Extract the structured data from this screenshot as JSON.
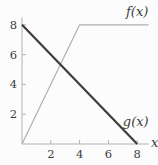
{
  "chart_data": {
    "type": "line",
    "title": "",
    "xlabel": "x",
    "ylabel": "",
    "xlim": [
      0,
      8.8
    ],
    "ylim": [
      0,
      8.5
    ],
    "x_ticks": [
      2,
      4,
      6,
      8
    ],
    "y_ticks": [
      2,
      4,
      6,
      8
    ],
    "grid": false,
    "legend": "inline-annotations",
    "series": [
      {
        "name": "f(x)",
        "points": [
          [
            0,
            0
          ],
          [
            4,
            8
          ],
          [
            8.8,
            8
          ]
        ],
        "color": "#aeaeae",
        "stroke_width": 1.2
      },
      {
        "name": "g(x)",
        "points": [
          [
            0,
            8
          ],
          [
            8,
            0
          ]
        ],
        "color": "#3d3d3d",
        "stroke_width": 2.2
      }
    ],
    "annotations": [
      {
        "text": "f(x)",
        "x": 8.0,
        "y": 8.6,
        "anchor": "middle",
        "italic": true
      },
      {
        "text": "g(x)",
        "x": 7.9,
        "y": 1.2,
        "anchor": "middle",
        "italic": true
      },
      {
        "text": "x",
        "x": 8.95,
        "y": -0.22,
        "anchor": "start",
        "italic": true
      }
    ],
    "axis_color": "#b2b2b2",
    "tick_color": "#b2b2b2",
    "text_color": "#3d3d3d"
  }
}
